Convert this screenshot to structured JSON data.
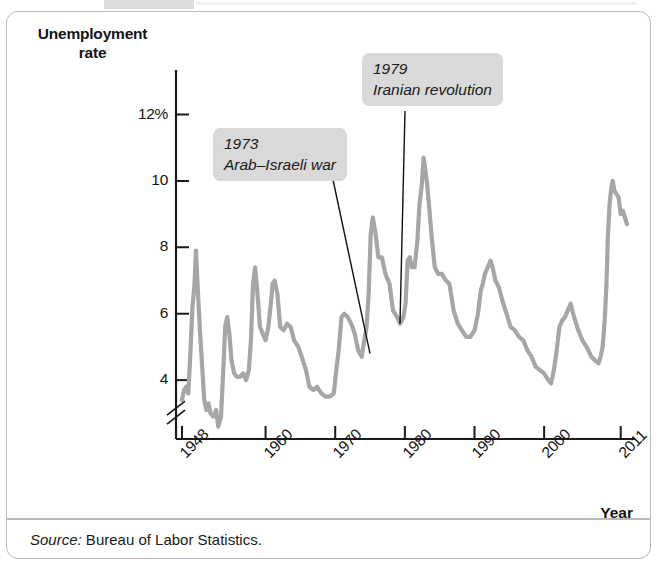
{
  "figure": {
    "y_axis_title_line1": "Unemployment",
    "y_axis_title_line2": "rate",
    "x_axis_title": "Year",
    "source_lead": "Source:",
    "source_text": " Bureau of Labor Statistics.",
    "line_color": "#a6a6a6",
    "callout_bg": "#d9d9d9",
    "axis_color": "#1a1a1a",
    "panel_border": "#b9b9b9"
  },
  "callouts": [
    {
      "id": "callout-1973",
      "year_label": "1973",
      "event_label": "Arab–Israeli war"
    },
    {
      "id": "callout-1979",
      "year_label": "1979",
      "event_label": "Iranian revolution"
    }
  ],
  "chart_data": {
    "type": "line",
    "title": "",
    "xlabel": "Year",
    "ylabel": "Unemployment rate",
    "ylim": [
      2.4,
      12.8
    ],
    "xlim": [
      1948,
      2011.9
    ],
    "grid": false,
    "legend": null,
    "axis_break_below": 4,
    "ytick_labels": [
      "12%",
      "10",
      "8",
      "6",
      "4"
    ],
    "ytick_values": [
      12,
      10,
      8,
      6,
      4
    ],
    "xtick_labels": [
      "1948",
      "1960",
      "1970",
      "1980",
      "1990",
      "2000",
      "2011"
    ],
    "xtick_values": [
      1948,
      1960,
      1970,
      1980,
      1990,
      2000,
      2011
    ],
    "annotations": [
      {
        "text": "1973 Arab–Israeli war",
        "points_to_x": 1975.0,
        "points_to_y": 4.8
      },
      {
        "text": "1979 Iranian revolution",
        "points_to_x": 1979.3,
        "points_to_y": 5.7
      }
    ],
    "series": [
      {
        "name": "U.S. civilian unemployment rate",
        "x": [
          1948.0,
          1948.3,
          1948.6,
          1948.9,
          1949.2,
          1949.5,
          1949.8,
          1950.0,
          1950.3,
          1950.6,
          1950.9,
          1951.2,
          1951.5,
          1951.8,
          1952.1,
          1952.5,
          1952.9,
          1953.2,
          1953.6,
          1953.9,
          1954.2,
          1954.5,
          1954.8,
          1955.1,
          1955.5,
          1955.9,
          1956.3,
          1956.8,
          1957.2,
          1957.6,
          1957.9,
          1958.2,
          1958.5,
          1958.8,
          1959.2,
          1959.6,
          1960.0,
          1960.4,
          1960.8,
          1961.0,
          1961.3,
          1961.7,
          1962.1,
          1962.6,
          1963.1,
          1963.6,
          1964.1,
          1964.7,
          1965.2,
          1965.8,
          1966.3,
          1966.9,
          1967.4,
          1968.0,
          1968.6,
          1969.2,
          1969.8,
          1970.1,
          1970.5,
          1970.9,
          1971.3,
          1971.8,
          1972.3,
          1972.8,
          1973.3,
          1973.8,
          1974.1,
          1974.5,
          1974.8,
          1975.1,
          1975.4,
          1975.8,
          1976.2,
          1976.7,
          1977.2,
          1977.8,
          1978.3,
          1978.9,
          1979.3,
          1979.8,
          1980.1,
          1980.4,
          1980.7,
          1981.0,
          1981.4,
          1981.8,
          1982.1,
          1982.4,
          1982.7,
          1982.9,
          1983.2,
          1983.5,
          1983.9,
          1984.3,
          1984.8,
          1985.3,
          1985.9,
          1986.4,
          1987.0,
          1987.6,
          1988.2,
          1988.8,
          1989.4,
          1990.0,
          1990.5,
          1990.9,
          1991.2,
          1991.5,
          1991.9,
          1992.3,
          1992.6,
          1993.0,
          1993.5,
          1994.0,
          1994.6,
          1995.2,
          1995.8,
          1996.4,
          1997.0,
          1997.6,
          1998.2,
          1998.8,
          1999.4,
          2000.0,
          2000.6,
          2001.0,
          2001.4,
          2001.8,
          2002.2,
          2002.6,
          2003.0,
          2003.4,
          2003.8,
          2004.3,
          2004.9,
          2005.5,
          2006.1,
          2006.8,
          2007.3,
          2007.8,
          2008.1,
          2008.4,
          2008.7,
          2008.95,
          2009.15,
          2009.4,
          2009.65,
          2009.85,
          2010.1,
          2010.4,
          2010.7,
          2011.0,
          2011.3,
          2011.6,
          2011.9
        ],
        "y": [
          3.4,
          3.7,
          3.8,
          3.6,
          4.8,
          6.2,
          6.9,
          7.9,
          6.6,
          5.4,
          4.4,
          3.4,
          3.1,
          3.3,
          3.0,
          2.9,
          3.1,
          2.6,
          2.9,
          4.2,
          5.6,
          5.9,
          5.4,
          4.6,
          4.2,
          4.1,
          4.1,
          4.2,
          4.0,
          4.3,
          5.2,
          6.9,
          7.4,
          6.7,
          5.6,
          5.4,
          5.2,
          5.6,
          6.4,
          6.9,
          7.0,
          6.6,
          5.6,
          5.5,
          5.7,
          5.6,
          5.2,
          5.0,
          4.7,
          4.3,
          3.8,
          3.7,
          3.8,
          3.6,
          3.5,
          3.5,
          3.6,
          4.2,
          4.9,
          5.9,
          6.0,
          5.9,
          5.7,
          5.4,
          4.9,
          4.7,
          5.1,
          5.6,
          6.6,
          8.4,
          8.9,
          8.4,
          7.7,
          7.7,
          7.2,
          6.9,
          6.1,
          5.9,
          5.7,
          5.9,
          6.3,
          7.6,
          7.7,
          7.4,
          7.4,
          8.2,
          9.3,
          9.8,
          10.7,
          10.4,
          9.9,
          9.2,
          8.2,
          7.4,
          7.2,
          7.2,
          7.0,
          6.9,
          6.1,
          5.7,
          5.5,
          5.3,
          5.3,
          5.5,
          6.0,
          6.7,
          6.9,
          7.2,
          7.4,
          7.6,
          7.4,
          7.0,
          6.8,
          6.4,
          6.0,
          5.6,
          5.5,
          5.3,
          5.2,
          4.9,
          4.7,
          4.4,
          4.3,
          4.2,
          4.0,
          3.9,
          4.3,
          4.9,
          5.6,
          5.8,
          5.9,
          6.1,
          6.3,
          5.9,
          5.5,
          5.2,
          5.0,
          4.7,
          4.6,
          4.5,
          4.7,
          5.0,
          5.8,
          6.9,
          8.3,
          9.3,
          9.8,
          10.0,
          9.7,
          9.6,
          9.5,
          9.0,
          9.1,
          8.9,
          8.7
        ]
      }
    ]
  }
}
